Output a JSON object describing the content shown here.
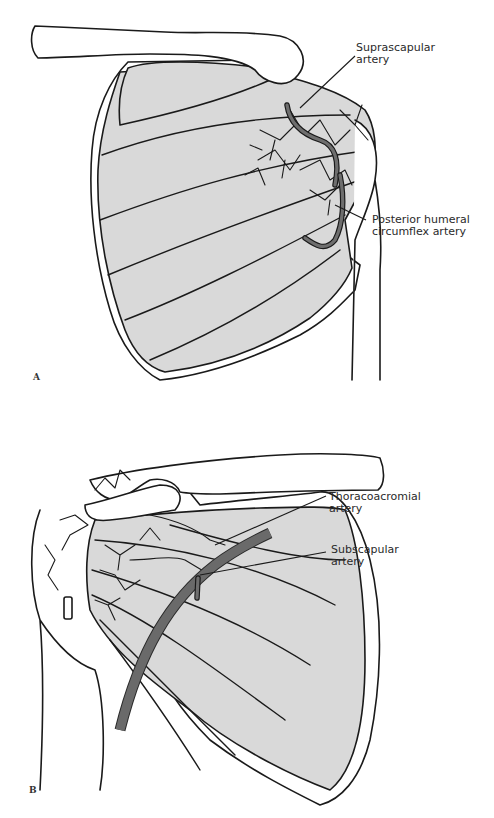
{
  "figure": {
    "panels": [
      {
        "letter": "A",
        "labels": [
          {
            "line1": "Suprascapular",
            "line2": "artery"
          },
          {
            "line1": "Posterior humeral",
            "line2": "circumflex artery"
          }
        ]
      },
      {
        "letter": "B",
        "labels": [
          {
            "line1": "Thoracoacromial",
            "line2": "artery"
          },
          {
            "line1": "Subscapular",
            "line2": "artery"
          }
        ]
      }
    ]
  },
  "colors": {
    "muscle_fill": "#d9d9d9",
    "outline": "#1a1a1a",
    "artery_fill": "#6e6e6e"
  }
}
